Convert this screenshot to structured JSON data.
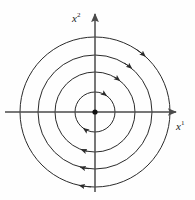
{
  "figure": {
    "kind": "phase-portrait",
    "background_color": "#fefefe",
    "stroke_color": "#2b2b2b",
    "axis_color": "#4a4a4a",
    "center": {
      "x": 95,
      "y": 112
    },
    "equilibrium_point": {
      "label": "origin-dot",
      "x": 95,
      "y": 112,
      "radius": 2.6,
      "fill": "#111111"
    },
    "axes": {
      "horizontal": {
        "name": "x1-axis",
        "label": "x",
        "superscript": "1",
        "x_start": 5,
        "x_end": 176,
        "y": 112,
        "arrow": "right"
      },
      "vertical": {
        "name": "x2-axis",
        "label": "x",
        "superscript": "2",
        "y_start": 192,
        "y_end": 14,
        "x": 95,
        "arrow": "up"
      }
    },
    "orbits": [
      {
        "name": "orbit-1",
        "radius": 20,
        "direction": "clockwise",
        "arrow_angles_deg": [
          55,
          235
        ]
      },
      {
        "name": "orbit-2",
        "radius": 40,
        "direction": "clockwise",
        "arrow_angles_deg": [
          52,
          250
        ]
      },
      {
        "name": "orbit-3",
        "radius": 57,
        "direction": "clockwise",
        "arrow_angles_deg": [
          50,
          255
        ]
      },
      {
        "name": "orbit-4",
        "radius": 75,
        "direction": "clockwise",
        "arrow_angles_deg": [
          48,
          258
        ]
      }
    ]
  },
  "chart_data": {
    "type": "scatter",
    "title": "",
    "xlabel": "x1",
    "ylabel": "x2",
    "center": [
      0,
      0
    ],
    "orbit_radii": [
      20,
      40,
      57,
      75
    ],
    "orbit_count": 4,
    "flow_direction": "clockwise",
    "grid": false,
    "legend": false
  }
}
